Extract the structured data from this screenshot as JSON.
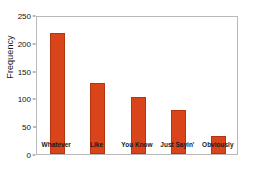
{
  "chart_data": {
    "type": "bar",
    "title": "",
    "xlabel": "",
    "ylabel": "Frequency",
    "categories": [
      "Whatever",
      "Like",
      "You Know",
      "Just Sayin'",
      "Obviously"
    ],
    "values": [
      217,
      127,
      103,
      79,
      33
    ],
    "ylim": [
      0,
      250
    ],
    "yticks": [
      0,
      50,
      100,
      150,
      200,
      250
    ],
    "ytick_labels": [
      "0",
      "50",
      "100",
      "150",
      "200",
      "250"
    ],
    "grid": false,
    "legend": false,
    "bar_color": "#d9441a",
    "bar_edge_color": "#b5350f",
    "frame_color": "#b9b9b9",
    "background": "#ffffff"
  }
}
